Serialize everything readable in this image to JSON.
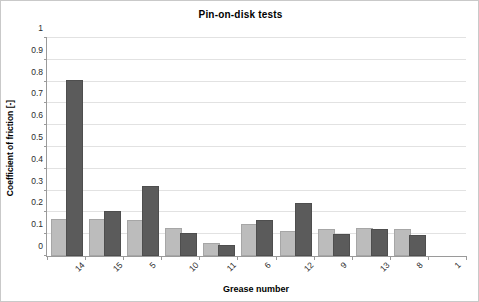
{
  "chart_data": {
    "type": "bar",
    "title": "Pin-on-disk tests",
    "xlabel": "Grease number",
    "ylabel": "Coefficient of friction [-]",
    "categories": [
      "14",
      "15",
      "5",
      "10",
      "11",
      "6",
      "12",
      "9",
      "13",
      "8",
      "1"
    ],
    "series": [
      {
        "name": "series-1",
        "color": "#bcbcbc",
        "values": [
          0.159,
          0.159,
          0.155,
          0.118,
          0.05,
          0.138,
          0.105,
          0.114,
          0.12,
          0.113,
          null
        ]
      },
      {
        "name": "series-2",
        "color": "#5b5b5b",
        "values": [
          0.8,
          0.198,
          0.31,
          0.098,
          0.042,
          0.155,
          0.234,
          0.093,
          0.114,
          0.088,
          null
        ]
      }
    ],
    "ylim": [
      0,
      1
    ],
    "ytick_labels": [
      "0",
      "0.1",
      "0.2",
      "0.3",
      "0.4",
      "0.5",
      "0.6",
      "0.7",
      "0.8",
      "0.9",
      "1"
    ],
    "ytick_values": [
      0,
      0.1,
      0.2,
      0.3,
      0.4,
      0.5,
      0.6,
      0.7,
      0.8,
      0.9,
      1
    ],
    "grid": true,
    "legend": "none"
  }
}
